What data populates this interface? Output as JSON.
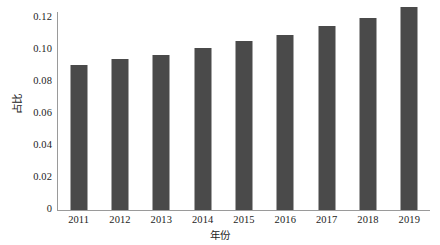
{
  "chart_data": {
    "type": "bar",
    "title": "",
    "subtitle": "",
    "xlabel": "年份",
    "ylabel": "占比",
    "categories": [
      "2011",
      "2012",
      "2013",
      "2014",
      "2015",
      "2016",
      "2017",
      "2018",
      "2019"
    ],
    "values": [
      0.09,
      0.0935,
      0.096,
      0.1,
      0.1045,
      0.1085,
      0.114,
      0.119,
      0.1255
    ],
    "series": [
      {
        "name": "占比",
        "values": [
          0.09,
          0.0935,
          0.096,
          0.1,
          0.1045,
          0.1085,
          0.114,
          0.119,
          0.1255
        ]
      }
    ],
    "ylim": [
      0,
      0.13
    ],
    "ytick_values": [
      0,
      0.02,
      0.04,
      0.06,
      0.08,
      0.1,
      0.12
    ],
    "ytick_labels": [
      "0",
      "0.02",
      "0.04",
      "0.06",
      "0.08",
      "0.10",
      "0.12"
    ],
    "xtick_labels": [
      "2011",
      "2012",
      "2013",
      "2014",
      "2015",
      "2016",
      "2017",
      "2018",
      "2019"
    ],
    "grid": false,
    "legend": false,
    "legend_position": "none",
    "bar_color": "#4a4a4a",
    "axis_color": "#9a9a9a",
    "text_color": "#1c1c1c",
    "background": "#ffffff",
    "annotations": []
  }
}
